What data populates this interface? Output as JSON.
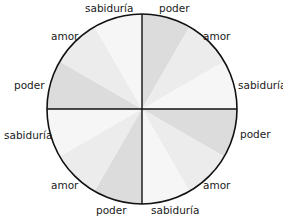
{
  "diagram": {
    "center": [
      142,
      109
    ],
    "radius": 95,
    "stroke_color": "#111111",
    "sector_colors": {
      "poder": "#dcdcdc",
      "amor": "#ececec",
      "sabiduria": "#f6f6f6"
    },
    "sectors": [
      {
        "label": "poder",
        "kind": "poder"
      },
      {
        "label": "amor",
        "kind": "amor"
      },
      {
        "label": "sabiduría",
        "kind": "sabiduria"
      },
      {
        "label": "poder",
        "kind": "poder"
      },
      {
        "label": "amor",
        "kind": "amor"
      },
      {
        "label": "sabiduría",
        "kind": "sabiduria"
      },
      {
        "label": "poder",
        "kind": "poder"
      },
      {
        "label": "amor",
        "kind": "amor"
      },
      {
        "label": "sabiduría",
        "kind": "sabiduria"
      },
      {
        "label": "poder",
        "kind": "poder"
      },
      {
        "label": "amor",
        "kind": "amor"
      },
      {
        "label": "sabiduría",
        "kind": "sabiduria"
      }
    ],
    "labels": [
      {
        "text": "poder",
        "x": 159,
        "y": 3
      },
      {
        "text": "amor",
        "x": 203,
        "y": 31
      },
      {
        "text": "sabiduría",
        "x": 238,
        "y": 80
      },
      {
        "text": "poder",
        "x": 240,
        "y": 129
      },
      {
        "text": "amor",
        "x": 203,
        "y": 180
      },
      {
        "text": "sabiduría",
        "x": 151,
        "y": 205
      },
      {
        "text": "poder",
        "x": 96,
        "y": 205
      },
      {
        "text": "amor",
        "x": 51,
        "y": 180
      },
      {
        "text": "sabiduría",
        "x": 4,
        "y": 130
      },
      {
        "text": "poder",
        "x": 14,
        "y": 80
      },
      {
        "text": "amor",
        "x": 51,
        "y": 31
      },
      {
        "text": "sabiduría",
        "x": 85,
        "y": 3
      }
    ]
  }
}
